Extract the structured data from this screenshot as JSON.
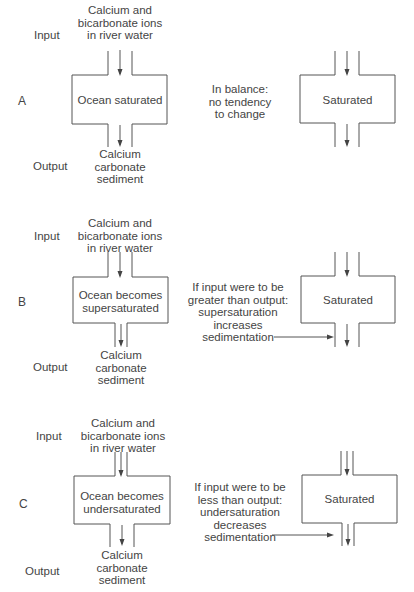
{
  "colors": {
    "line": "#555555",
    "text": "#444444",
    "background": "#ffffff"
  },
  "labels": {
    "input": "Input",
    "output": "Output",
    "input_source": [
      "Calcium and",
      "bicarbonate ions",
      "in river water"
    ],
    "output_sink": [
      "Calcium",
      "carbonate",
      "sediment"
    ],
    "saturated": "Saturated"
  },
  "panels": [
    {
      "id": "A",
      "letter": "A",
      "ocean_state": [
        "Ocean saturated"
      ],
      "annotation": [
        "In balance:",
        "no tendency",
        "to change"
      ],
      "has_annotation_arrow": false
    },
    {
      "id": "B",
      "letter": "B",
      "ocean_state": [
        "Ocean becomes",
        "supersaturated"
      ],
      "annotation": [
        "If input were to be",
        "greater than output:",
        "supersaturation",
        "increases",
        "sedimentation"
      ],
      "has_annotation_arrow": true
    },
    {
      "id": "C",
      "letter": "C",
      "ocean_state": [
        "Ocean becomes",
        "undersaturated"
      ],
      "annotation": [
        "If input were to be",
        "less than output:",
        "undersaturation",
        "decreases",
        "sedimentation"
      ],
      "has_annotation_arrow": true
    }
  ]
}
